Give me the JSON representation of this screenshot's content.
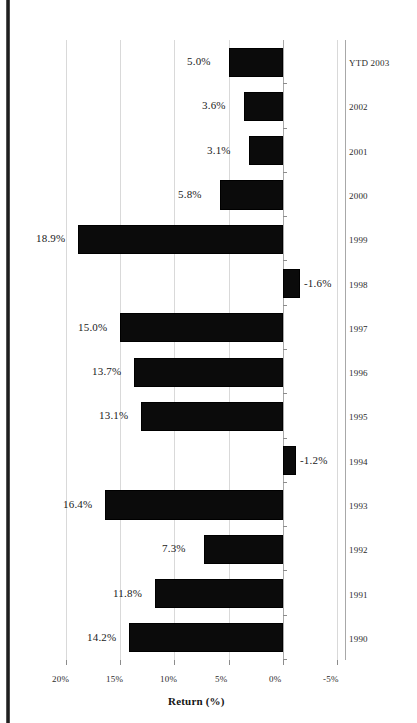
{
  "figure": {
    "orientation": "rotated-90-ccw",
    "axis_title": "Return (%)",
    "bar_color": "#0b0b0b",
    "grid_color": "#d9d9d9",
    "axis_color": "#a8a8a8"
  },
  "chart_data": {
    "type": "bar",
    "title": "",
    "xlabel": "",
    "ylabel": "Return (%)",
    "orientation": "horizontal",
    "categories": [
      "1990",
      "1991",
      "1992",
      "1993",
      "1994",
      "1995",
      "1996",
      "1997",
      "1998",
      "1999",
      "2000",
      "2001",
      "2002",
      "YTD 2003"
    ],
    "values": [
      14.2,
      11.8,
      7.3,
      16.4,
      -1.2,
      13.1,
      13.7,
      15.0,
      -1.6,
      18.9,
      5.8,
      3.1,
      3.6,
      5.0
    ],
    "data_labels": [
      "14.2%",
      "11.8%",
      "7.3%",
      "16.4%",
      "-1.2%",
      "13.1%",
      "13.7%",
      "15.0%",
      "-1.6%",
      "18.9%",
      "5.8%",
      "3.1%",
      "3.6%",
      "5.0%"
    ],
    "ylim": [
      -5,
      20
    ],
    "ytick_values": [
      20,
      15,
      10,
      5,
      0,
      -5
    ],
    "ytick_labels": [
      "20%",
      "15%",
      "10%",
      "5%",
      "0%",
      "-5%"
    ],
    "grid": true,
    "legend": false,
    "series": [
      {
        "name": "Return (%)",
        "values": [
          14.2,
          11.8,
          7.3,
          16.4,
          -1.2,
          13.1,
          13.7,
          15.0,
          -1.6,
          18.9,
          5.8,
          3.1,
          3.6,
          5.0
        ]
      }
    ]
  }
}
